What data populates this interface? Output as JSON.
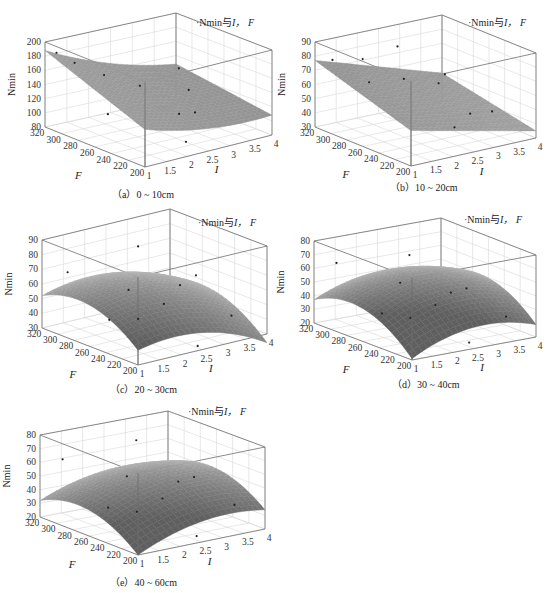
{
  "figure": {
    "legend_text": "Nmin与I，F",
    "legend_prefix": "·Nmin",
    "legend_mid": "与",
    "legend_I": "I，",
    "legend_F": "F",
    "surface_color": "#8a8a8a",
    "panels": [
      {
        "id": "a",
        "caption": "（a）0 ~ 10cm",
        "zticks": [
          "200",
          "180",
          "160",
          "140",
          "120",
          "100",
          "80"
        ]
      },
      {
        "id": "b",
        "caption": "（b）10 ~ 20cm",
        "zticks": [
          "90",
          "80",
          "70",
          "60",
          "50",
          "40",
          "30"
        ]
      },
      {
        "id": "c",
        "caption": "（c）20 ~ 30cm",
        "zticks": [
          "90",
          "80",
          "70",
          "60",
          "50",
          "40",
          "30"
        ]
      },
      {
        "id": "d",
        "caption": "（d）30 ~ 40cm",
        "zticks": [
          "80",
          "70",
          "60",
          "50",
          "40",
          "30",
          "20"
        ]
      },
      {
        "id": "e",
        "caption": "（e）40 ~ 60cm",
        "zticks": [
          "80",
          "70",
          "60",
          "50",
          "40",
          "30",
          "20"
        ]
      }
    ],
    "f_ticks": [
      "320",
      "300",
      "280",
      "260",
      "240",
      "220",
      "200"
    ],
    "i_ticks": [
      "1",
      "1.5",
      "2",
      "2.5",
      "3",
      "3.5",
      "4"
    ],
    "z_axis_label": "Nmin",
    "f_axis_label": "F",
    "i_axis_label": "I"
  },
  "chart_data": [
    {
      "type": "surface3d",
      "title": "（a）0 ~ 10cm",
      "legend": "Nmin与I，F",
      "xlabel": "I",
      "ylabel": "F",
      "zlabel": "Nmin",
      "x_ticks": [
        1,
        1.5,
        2,
        2.5,
        3,
        3.5,
        4
      ],
      "y_ticks": [
        200,
        220,
        240,
        260,
        280,
        300,
        320
      ],
      "zlim": [
        80,
        200
      ],
      "z_ticks": [
        80,
        100,
        120,
        140,
        160,
        180,
        200
      ],
      "surface_corners": {
        "I1_F320": 188,
        "I1_F200": 125,
        "I4_F320": 110,
        "I4_F200": 90
      },
      "description": "Surface decreasing with increasing I; highest at I=1, F=320 (~188), lowest near I=3.5-4 (~85-95)"
    },
    {
      "type": "surface3d",
      "title": "（b）10 ~ 20cm",
      "legend": "Nmin与I，F",
      "xlabel": "I",
      "ylabel": "F",
      "zlabel": "Nmin",
      "x_ticks": [
        1,
        1.5,
        2,
        2.5,
        3,
        3.5,
        4
      ],
      "y_ticks": [
        200,
        220,
        240,
        260,
        280,
        300,
        320
      ],
      "zlim": [
        30,
        90
      ],
      "z_ticks": [
        30,
        40,
        50,
        60,
        70,
        80,
        90
      ],
      "surface_corners": {
        "I1_F320": 77,
        "I1_F200": 52,
        "I4_F320": 50,
        "I4_F200": 35
      },
      "description": "Near-planar surface decreasing with I; ~77 at I=1,F=320 to ~35 at I=4"
    },
    {
      "type": "surface3d",
      "title": "（c）20 ~ 30cm",
      "legend": "Nmin与I，F",
      "xlabel": "I",
      "ylabel": "F",
      "zlabel": "Nmin",
      "x_ticks": [
        1,
        1.5,
        2,
        2.5,
        3,
        3.5,
        4
      ],
      "y_ticks": [
        200,
        220,
        240,
        260,
        280,
        300,
        320
      ],
      "zlim": [
        30,
        90
      ],
      "z_ticks": [
        30,
        40,
        50,
        60,
        70,
        80,
        90
      ],
      "surface_corners": {
        "I1_F320": 52,
        "I1_F200": 40,
        "I4_F320": 45,
        "I4_F200": 37
      },
      "description": "Saddle-like dome, peak ~65 around I=1.5-2, F=260; declining to ~37 at I=4"
    },
    {
      "type": "surface3d",
      "title": "（d）30 ~ 40cm",
      "legend": "Nmin与I，F",
      "xlabel": "I",
      "ylabel": "F",
      "zlabel": "Nmin",
      "x_ticks": [
        1,
        1.5,
        2,
        2.5,
        3,
        3.5,
        4
      ],
      "y_ticks": [
        200,
        220,
        240,
        260,
        280,
        300,
        320
      ],
      "zlim": [
        20,
        80
      ],
      "z_ticks": [
        20,
        30,
        40,
        50,
        60,
        70,
        80
      ],
      "surface_corners": {
        "I1_F320": 37,
        "I1_F200": 22,
        "I4_F320": 40,
        "I4_F200": 30
      },
      "description": "Dome-shaped surface, peak ~60 around I=1.5-2, F=260; ~30 at I=4"
    },
    {
      "type": "surface3d",
      "title": "（e）40 ~ 60cm",
      "legend": "Nmin与I，F",
      "xlabel": "I",
      "ylabel": "F",
      "zlabel": "Nmin",
      "x_ticks": [
        1,
        1.5,
        2,
        2.5,
        3,
        3.5,
        4
      ],
      "y_ticks": [
        200,
        220,
        240,
        260,
        280,
        300,
        320
      ],
      "zlim": [
        20,
        80
      ],
      "z_ticks": [
        20,
        30,
        40,
        50,
        60,
        70,
        80
      ],
      "surface_corners": {
        "I1_F320": 32,
        "I1_F200": 22,
        "I4_F320": 42,
        "I4_F200": 34
      },
      "description": "Dome-shaped surface, peak ~60 around I=2, F=260; ~35 at I=4"
    }
  ]
}
